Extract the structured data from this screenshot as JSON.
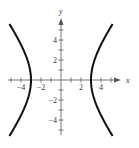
{
  "chart_data": {
    "type": "line",
    "title": "",
    "xlabel": "x",
    "ylabel": "y",
    "equation": "x^2/9 - y^2/16 = 1",
    "xlim": [
      -5,
      5
    ],
    "ylim": [
      -5,
      5
    ],
    "grid": false,
    "x_tick_labels": [
      "-4",
      "-2",
      "2",
      "4"
    ],
    "y_tick_labels": [
      "4",
      "2",
      "-2",
      "-4"
    ],
    "x_ticks": [
      -5,
      -4,
      -3,
      -2,
      -1,
      1,
      2,
      3,
      4,
      5
    ],
    "y_ticks": [
      -5,
      -4,
      -3,
      -2,
      -1,
      1,
      2,
      3,
      4,
      5
    ],
    "series": [
      {
        "name": "left branch",
        "vertex": [
          -3,
          0
        ],
        "y_range": [
          -5.6,
          5.6
        ]
      },
      {
        "name": "right branch",
        "vertex": [
          3,
          0
        ],
        "y_range": [
          -5.6,
          5.6
        ]
      }
    ],
    "line_color": "#111111"
  },
  "layout": {
    "origin_px": [
      61,
      80
    ],
    "unit_px": 10
  }
}
